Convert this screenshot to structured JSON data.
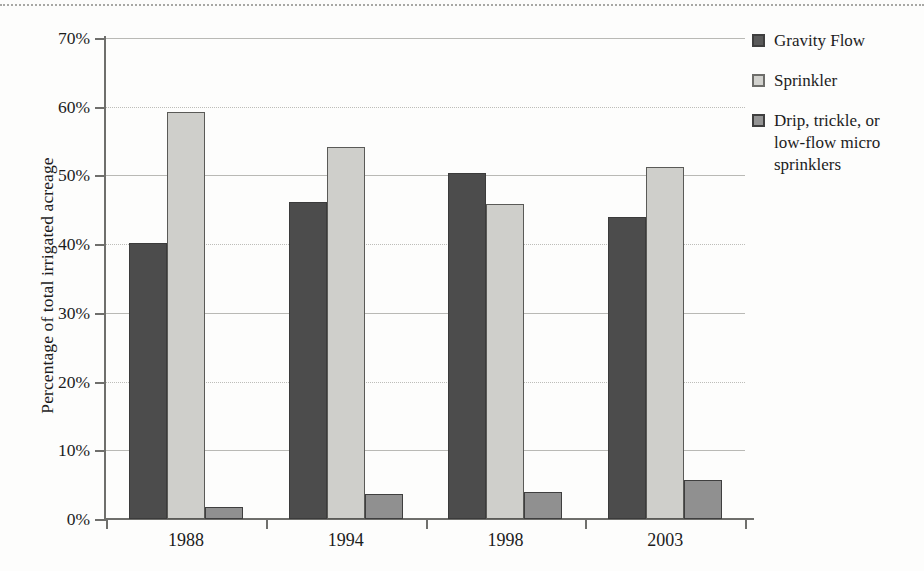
{
  "chart_data": {
    "type": "bar",
    "title": "",
    "subtitle": "",
    "xlabel": "",
    "ylabel": "Percentage of total irrigated acreage",
    "categories": [
      "1988",
      "1994",
      "1998",
      "2003"
    ],
    "ylim": [
      0,
      70
    ],
    "ytick_values": [
      0,
      10,
      20,
      30,
      40,
      50,
      60,
      70
    ],
    "ytick_labels": [
      "0%",
      "10%",
      "20%",
      "30%",
      "40%",
      "50%",
      "60%",
      "70%"
    ],
    "grid": "horizontal",
    "legend_position": "right",
    "series": [
      {
        "name": "Gravity Flow",
        "color": "#4c4c4c",
        "values": [
          40.1,
          46.2,
          50.3,
          44.0
        ]
      },
      {
        "name": "Sprinkler",
        "color": "#cfcfcb",
        "values": [
          59.3,
          54.1,
          45.8,
          51.3
        ]
      },
      {
        "name": "Drip, trickle, or low-flow micro sprinklers",
        "color": "#909090",
        "values": [
          1.7,
          3.6,
          4.0,
          5.7
        ]
      }
    ],
    "annotations": []
  },
  "legend": {
    "items": [
      {
        "label": "Gravity Flow"
      },
      {
        "label": "Sprinkler"
      },
      {
        "label": "Drip, trickle, or low-flow micro sprinklers"
      }
    ]
  }
}
